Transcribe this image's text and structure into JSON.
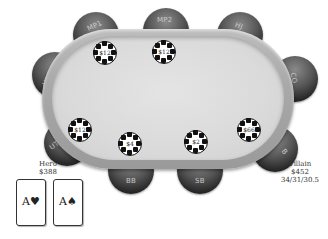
{
  "table": {
    "felt_color": "#dcdcdc",
    "rail_color": "#a8a8a8",
    "seat_color": "#333333"
  },
  "seats": [
    {
      "position": "UTG+1",
      "label": "UTG+1"
    },
    {
      "position": "MP1",
      "label": "MP1"
    },
    {
      "position": "MP2",
      "label": "MP2"
    },
    {
      "position": "HJ",
      "label": "HJ"
    },
    {
      "position": "CO",
      "label": "CO"
    },
    {
      "position": "BTN",
      "label": "B"
    },
    {
      "position": "SB",
      "label": "SB"
    },
    {
      "position": "BB",
      "label": "BB"
    },
    {
      "position": "UTG",
      "label": "UTG"
    }
  ],
  "bets": [
    {
      "seat": "MP1",
      "amount": "$12"
    },
    {
      "seat": "MP2",
      "amount": "$12"
    },
    {
      "seat": "UTG",
      "amount": "$12"
    },
    {
      "seat": "BB",
      "amount": "$4"
    },
    {
      "seat": "SB",
      "amount": "$2"
    },
    {
      "seat": "BTN",
      "amount": "$66"
    }
  ],
  "hero": {
    "name": "Hero",
    "stack": "$388",
    "cards": [
      {
        "rank": "A",
        "suit": "♥",
        "label": "A♥"
      },
      {
        "rank": "A",
        "suit": "♠",
        "label": "A♠"
      }
    ]
  },
  "villain": {
    "name": "Villain",
    "stack": "$452",
    "stats": "34/31/30.5"
  }
}
